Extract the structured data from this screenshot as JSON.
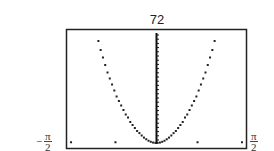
{
  "chart_data": {
    "type": "scatter",
    "title": "",
    "xlabel": "",
    "ylabel": "",
    "window": {
      "xmin_label": "-π/2",
      "xmax_label": "π/2",
      "ymax_label": "72",
      "xlim": [
        -1.5708,
        1.5708
      ],
      "ylim": [
        0,
        72
      ]
    },
    "grid": false,
    "axes": {
      "y_axis_at_x": 0,
      "y_axis_ticks": true
    },
    "series": [
      {
        "name": "curve",
        "style": "dots",
        "x": [
          -1.02,
          -0.98,
          -0.94,
          -0.9,
          -0.86,
          -0.82,
          -0.78,
          -0.74,
          -0.7,
          -0.66,
          -0.62,
          -0.58,
          -0.54,
          -0.5,
          -0.46,
          -0.42,
          -0.38,
          -0.34,
          -0.3,
          -0.26,
          -0.22,
          -0.18,
          -0.14,
          -0.1,
          -0.06,
          -0.02,
          0.02,
          0.06,
          0.1,
          0.14,
          0.18,
          0.22,
          0.26,
          0.3,
          0.34,
          0.38,
          0.42,
          0.46,
          0.5,
          0.54,
          0.58,
          0.62,
          0.66,
          0.7,
          0.74,
          0.78,
          0.82,
          0.86,
          0.9,
          0.94,
          0.98,
          1.02
        ],
        "y": [
          68,
          62,
          57,
          52,
          47,
          43,
          39,
          35,
          31,
          28,
          25,
          22,
          19,
          17,
          14,
          12,
          10,
          8,
          6.6,
          5,
          3.6,
          2.5,
          1.5,
          0.8,
          0.3,
          0.1,
          0.1,
          0.3,
          0.8,
          1.5,
          2.5,
          3.6,
          5,
          6.6,
          8,
          10,
          12,
          14,
          17,
          19,
          22,
          25,
          28,
          31,
          35,
          39,
          43,
          47,
          52,
          57,
          62,
          68
        ]
      },
      {
        "name": "stray-points",
        "style": "dots",
        "x": [
          -1.5,
          -0.72,
          0.72,
          1.5
        ],
        "y": [
          0.5,
          0.5,
          0.5,
          0.5
        ]
      }
    ]
  },
  "labels": {
    "ymax": "72",
    "xmin_sign": "−",
    "xmin_num": "π",
    "xmin_den": "2",
    "xmax_num": "π",
    "xmax_den": "2"
  }
}
